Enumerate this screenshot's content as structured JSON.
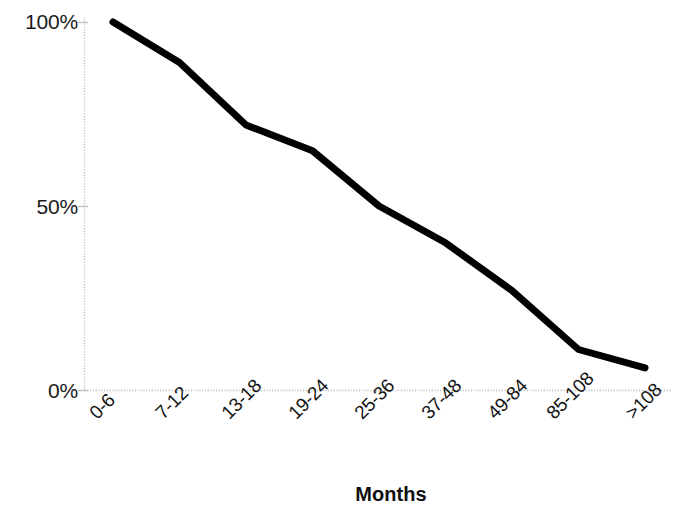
{
  "chart_data": {
    "type": "line",
    "title": "",
    "subtitle": "",
    "xlabel": "Months",
    "ylabel": "",
    "categories": [
      "0-6",
      "7-12",
      "13-18",
      "19-24",
      "25-36",
      "37-48",
      "49-84",
      "85-108",
      ">108"
    ],
    "values": [
      100,
      89,
      72,
      65,
      50,
      40,
      27,
      11,
      6
    ],
    "series": [
      {
        "name": "",
        "values": [
          100,
          89,
          72,
          65,
          50,
          40,
          27,
          11,
          6
        ]
      }
    ],
    "ylim": [
      0,
      100
    ],
    "ytick_labels": [
      "100%",
      "50%",
      "0%"
    ],
    "ytick_values": [
      100,
      50,
      0
    ],
    "grid": false,
    "legend": false,
    "legend_position": "none",
    "line_color": "#000000",
    "line_width": 7,
    "axis_color": "#c9c9c9",
    "annotations": []
  },
  "axes": {
    "y": {
      "ticks": [
        {
          "label": "100%",
          "value": 100
        },
        {
          "label": "50%",
          "value": 50
        },
        {
          "label": "0%",
          "value": 0
        }
      ]
    },
    "x": {
      "title": "Months",
      "ticks": [
        {
          "label": "0-6"
        },
        {
          "label": "7-12"
        },
        {
          "label": "13-18"
        },
        {
          "label": "19-24"
        },
        {
          "label": "25-36"
        },
        {
          "label": "37-48"
        },
        {
          "label": "49-84"
        },
        {
          "label": "85-108"
        },
        {
          "label": ">108"
        }
      ]
    }
  }
}
